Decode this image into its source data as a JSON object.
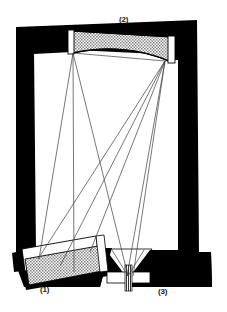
{
  "figure": {
    "kind": "optical-instrument-cross-section",
    "background_color": "#ffffff",
    "ink_color": "#000000",
    "stipple_color": "#a8a8a8",
    "ray_color": "#3c3c3c",
    "width": 227,
    "height": 312
  },
  "callouts": [
    {
      "id": "1",
      "label": "(1)",
      "refers_to": "tilted-prism-mirror-assembly"
    },
    {
      "id": "2",
      "label": "(2)",
      "refers_to": "concave-grating-mirror"
    },
    {
      "id": "3",
      "label": "(3)",
      "refers_to": "entrance-exit-slit"
    }
  ],
  "components": {
    "housing": {
      "name": "instrument-housing",
      "fill": "#000000",
      "outline": "black filled frame, slightly skewed rectangle"
    },
    "cavity": {
      "name": "optical-cavity",
      "fill": "#ffffff"
    },
    "element_1": {
      "name": "tilted-prism-mirror",
      "face_fill": "#ffffff",
      "coating_fill": "#a8a8a8",
      "tilt": "tilted, lower-left of cavity"
    },
    "element_2": {
      "name": "concave-grating-mirror",
      "fill": "#a8a8a8",
      "shape": "flat top edge, concave curved bottom edge"
    },
    "element_3": {
      "name": "slit-assembly",
      "fill": "#ffffff",
      "detail": "narrow vertical slit flanked by white jaws inside black funnel"
    }
  },
  "ray_trace": {
    "name": "ray-bundle",
    "node_left": {
      "x": 73,
      "y": 52
    },
    "node_right": {
      "x": 165,
      "y": 61
    },
    "node_slit": {
      "x": 128,
      "y": 276
    },
    "node_prism_a": {
      "x": 38,
      "y": 258
    },
    "node_prism_b": {
      "x": 88,
      "y": 250
    },
    "stroke_width": 0.7,
    "count": 9
  }
}
